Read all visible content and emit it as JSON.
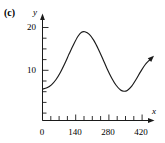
{
  "figure": {
    "panel_label": "(c)",
    "background_color": "#ffffff",
    "curve_color": "#1a1a1a",
    "axis_color": "#1a1a1a"
  },
  "chart_data": {
    "type": "line",
    "title": "",
    "subtitle": "",
    "xlabel": "x",
    "ylabel": "y",
    "xlim": [
      0,
      490
    ],
    "ylim": [
      0,
      22
    ],
    "grid": false,
    "legend": null,
    "x_ticks_major": [
      0,
      140,
      280,
      420
    ],
    "x_tick_labels": [
      "0",
      "140",
      "280",
      "420"
    ],
    "x_ticks_minor_step": 35,
    "y_ticks_major": [
      10,
      20
    ],
    "y_tick_labels": [
      "10",
      "20"
    ],
    "y_ticks_minor_step": 2.5,
    "arrow_head_end": true,
    "annotations": [],
    "series": [
      {
        "name": "curve",
        "x": [
          0,
          20,
          40,
          60,
          80,
          100,
          120,
          140,
          160,
          175,
          190,
          210,
          230,
          250,
          270,
          290,
          310,
          330,
          350,
          365,
          380,
          400,
          420,
          440,
          460,
          480,
          490
        ],
        "y": [
          5.6,
          5.9,
          6.6,
          7.8,
          9.5,
          11.6,
          13.9,
          16.1,
          18.0,
          18.9,
          19.0,
          18.4,
          17.0,
          15.0,
          12.7,
          10.3,
          8.2,
          6.5,
          5.4,
          5.1,
          5.3,
          6.3,
          7.9,
          9.7,
          11.3,
          12.4,
          12.9
        ]
      }
    ],
    "key_points": {
      "start": {
        "x": 0,
        "y": 5.6
      },
      "maximum": {
        "x": 185,
        "y": 19.0
      },
      "minimum": {
        "x": 365,
        "y": 5.1
      },
      "end": {
        "x": 490,
        "y": 12.9
      }
    }
  },
  "axis_label_names": {
    "x": "x",
    "y": "y"
  }
}
